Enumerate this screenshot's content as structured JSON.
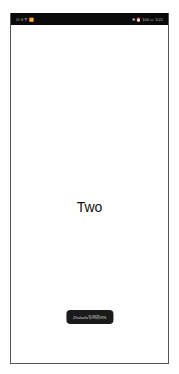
{
  "status_bar": {
    "left_icons": "⊡ ≋ ᯤ 📶",
    "right_text": "✱ ⏰ 100 ▭ 3:21"
  },
  "main": {
    "title": "Two"
  },
  "toast": {
    "text": "Zhulanlu专用的RN"
  },
  "colors": {
    "status_bar_bg": "#0a0a0a",
    "toast_bg": "#1a1a1a",
    "page_bg": "#ffffff"
  }
}
